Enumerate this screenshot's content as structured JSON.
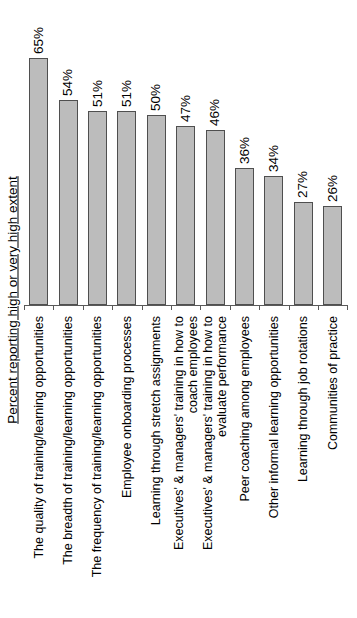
{
  "chart_data": {
    "type": "bar",
    "title": "",
    "xlabel": "",
    "ylabel": "Percent reporting high or very high extent",
    "categories": [
      "The quality of training/learning opportunities",
      "The breadth of training/learning opportunities",
      "The frequency of training/learning opportunities",
      "Employee onboarding processes",
      "Learning through stretch assignments",
      "Executives' & managers' training in how to\ncoach employees",
      "Executives' & managers' training in how to\nevaluate performance",
      "Peer coaching among employees",
      "Other informal learning opportunities",
      "Learning through job rotations",
      "Communities of practice"
    ],
    "values": [
      65,
      54,
      51,
      51,
      50,
      47,
      46,
      36,
      34,
      27,
      26
    ],
    "value_labels": [
      "65%",
      "54%",
      "51%",
      "51%",
      "50%",
      "47%",
      "46%",
      "36%",
      "34%",
      "27%",
      "26%"
    ],
    "ylim": [
      0,
      70
    ],
    "unit": "%",
    "grid": false,
    "legend": null,
    "value_label_rotation_deg": 90,
    "category_label_rotation_deg": 90,
    "style": {
      "bar_fill": "#bcbcbc",
      "bar_border": "#4f4f4f",
      "axis_color": "#595959",
      "text_color": "#000000",
      "background": "#ffffff"
    }
  }
}
